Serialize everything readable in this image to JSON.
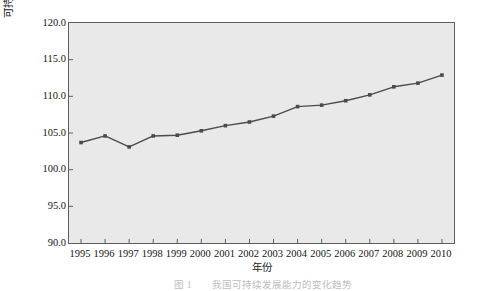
{
  "chart_data": {
    "type": "line",
    "title": "",
    "xlabel": "年份",
    "ylabel": "可持续发展能力(1995年全国为100)",
    "categories": [
      "1995",
      "1996",
      "1997",
      "1998",
      "1999",
      "2000",
      "2001",
      "2002",
      "2003",
      "2004",
      "2005",
      "2006",
      "2007",
      "2008",
      "2009",
      "2010"
    ],
    "values": [
      103.7,
      104.6,
      103.1,
      104.6,
      104.7,
      105.3,
      106.0,
      106.5,
      107.3,
      108.6,
      108.8,
      109.4,
      110.2,
      111.3,
      111.8,
      112.9
    ],
    "ylim": [
      90.0,
      120.0
    ],
    "ytick_labels": [
      "120.0",
      "115.0",
      "110.0",
      "105.0",
      "100.0",
      "95.0",
      "90.0"
    ],
    "ytick_values": [
      120.0,
      115.0,
      110.0,
      105.0,
      100.0,
      95.0,
      90.0
    ],
    "grid": false,
    "legend": "none",
    "series_color": "#4a4a52",
    "marker": "square",
    "plot_background": "#e9e9e9",
    "axis_color": "#5e5e5e"
  },
  "caption": {
    "text": "图 1　　我国可持续发展能力的变化趋势"
  }
}
